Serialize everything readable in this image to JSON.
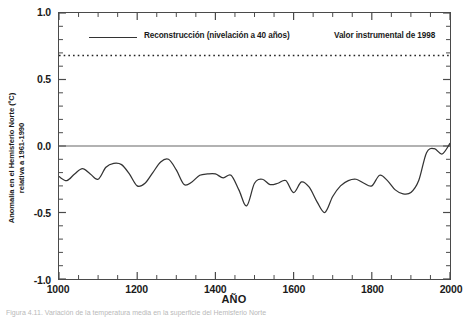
{
  "figure": {
    "caption": "Figura 4.11. Variación de la temperatura media en la superficie del Hemisferio Norte"
  },
  "legend": {
    "position": "top-inside",
    "reconstruction_label": "Reconstrucción (nivelación a 40 años)",
    "instrumental_label": "Valor instrumental de 1998",
    "line_sample_name": "solid-line-sample"
  },
  "chart_data": {
    "type": "line",
    "title": "",
    "subtitle": "",
    "xlabel": "AÑO",
    "ylabel": "Anomalía en el Hemisferio Norte (ºC) relativa a 1961-1990",
    "ylabel_line1": "Anomalía en el Hemisferio Norte (ºC)",
    "ylabel_line2": "relativa a 1961-1990",
    "xlim": [
      1000,
      2000
    ],
    "ylim": [
      -1.0,
      1.0
    ],
    "grid": false,
    "zero_line": 0.0,
    "xticks": [
      1000,
      1200,
      1400,
      1600,
      1800,
      2000
    ],
    "xtick_labels": [
      "1000",
      "1200",
      "1400",
      "1600",
      "1800",
      "2000"
    ],
    "xminor_step": 50,
    "yticks": [
      1.0,
      0.5,
      0.0,
      -0.5,
      -1.0
    ],
    "ytick_labels": [
      "1.0",
      "0.5",
      "0.0",
      "-0.5",
      "-1.0"
    ],
    "yminor_step": 0.1,
    "annotations": [
      {
        "name": "instrumental-1998-line",
        "type": "horizontal-dotted-line",
        "value": 0.68,
        "label": "Valor instrumental de 1998"
      }
    ],
    "series": [
      {
        "name": "Reconstrucción (nivelación a 40 años)",
        "color": "#333333",
        "style": "solid",
        "x": [
          1000,
          1020,
          1040,
          1060,
          1080,
          1100,
          1120,
          1140,
          1160,
          1180,
          1200,
          1220,
          1240,
          1260,
          1280,
          1300,
          1320,
          1340,
          1360,
          1380,
          1400,
          1420,
          1440,
          1460,
          1480,
          1500,
          1520,
          1540,
          1560,
          1580,
          1600,
          1620,
          1640,
          1660,
          1680,
          1700,
          1720,
          1740,
          1760,
          1780,
          1800,
          1820,
          1840,
          1860,
          1880,
          1900,
          1920,
          1940,
          1960,
          1980,
          2000
        ],
        "values": [
          -0.23,
          -0.26,
          -0.21,
          -0.17,
          -0.21,
          -0.25,
          -0.16,
          -0.13,
          -0.14,
          -0.21,
          -0.3,
          -0.28,
          -0.2,
          -0.12,
          -0.1,
          -0.18,
          -0.29,
          -0.27,
          -0.22,
          -0.21,
          -0.21,
          -0.24,
          -0.22,
          -0.33,
          -0.45,
          -0.28,
          -0.25,
          -0.29,
          -0.28,
          -0.26,
          -0.35,
          -0.27,
          -0.31,
          -0.42,
          -0.5,
          -0.38,
          -0.3,
          -0.26,
          -0.25,
          -0.28,
          -0.3,
          -0.22,
          -0.26,
          -0.33,
          -0.36,
          -0.35,
          -0.26,
          -0.05,
          -0.02,
          -0.06,
          0.02
        ]
      }
    ]
  }
}
